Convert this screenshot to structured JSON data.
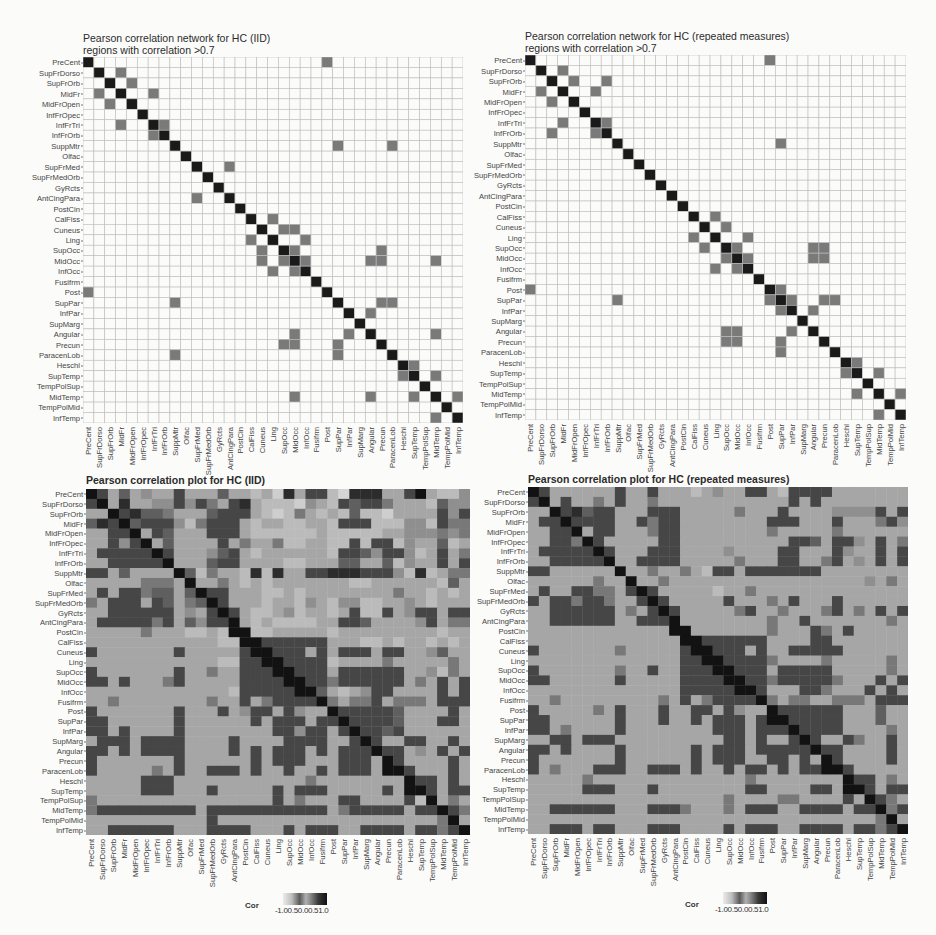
{
  "regions": [
    "PreCent",
    "SupFrDorso",
    "SupFrOrb",
    "MidFr",
    "MidFrOpen",
    "InfFrOpec",
    "InfFrTri",
    "InfFrOrb",
    "SuppMtr",
    "Olfac",
    "SupFrMed",
    "SupFrMedOrb",
    "GyRcts",
    "AntCingPara",
    "PostCin",
    "CalFiss",
    "Cuneus",
    "Ling",
    "SupOcc",
    "MidOcc",
    "InfOcc",
    "Fusifrm",
    "Post",
    "SupPar",
    "InfPar",
    "SupMarg",
    "Angular",
    "Precun",
    "ParacenLob",
    "Heschl",
    "SupTemp",
    "TempPolSup",
    "MidTemp",
    "TempPolMid",
    "InfTemp"
  ],
  "colors": {
    "diagonal": "#1a1a1a",
    "edge": "#7a7a7a",
    "empty": "#fbfbfa",
    "gridline": "#bdbdbd",
    "scale_low": "#e6e6e6",
    "scale_high": "#111111"
  },
  "panels": {
    "net_iid": {
      "title_line1": "Pearson correlation network for HC (IID)",
      "title_line2": "regions with correlation >0.7"
    },
    "net_rm": {
      "title_line1": "Pearson correlation network for HC (repeated measures)",
      "title_line2": "regions with correlation >0.7"
    },
    "cor_iid": {
      "title": "Pearson correlation plot for HC (IID)"
    },
    "cor_rm": {
      "title": "Pearson correlation plot for HC (repeated measures)"
    }
  },
  "legend": {
    "title": "Cor",
    "ticks": [
      "-1.0",
      "-0.5",
      "0.0",
      "0.5",
      "1.0"
    ],
    "tick_text": "-1.00.50.00.51.0"
  },
  "chart_data": [
    {
      "type": "heatmap",
      "title": "Pearson correlation network for HC (IID)",
      "subtitle": "regions with correlation >0.7",
      "threshold": 0.7,
      "xlabel": "",
      "ylabel": "",
      "edges": [
        [
          0,
          22
        ],
        [
          1,
          3
        ],
        [
          2,
          4
        ],
        [
          3,
          6
        ],
        [
          6,
          7
        ],
        [
          8,
          23
        ],
        [
          8,
          28
        ],
        [
          10,
          13
        ],
        [
          15,
          17
        ],
        [
          16,
          18
        ],
        [
          16,
          19
        ],
        [
          17,
          20
        ],
        [
          18,
          19
        ],
        [
          19,
          20
        ],
        [
          18,
          27
        ],
        [
          19,
          26
        ],
        [
          19,
          27
        ],
        [
          19,
          32
        ],
        [
          23,
          27
        ],
        [
          23,
          28
        ],
        [
          24,
          26
        ],
        [
          26,
          32
        ],
        [
          29,
          30
        ],
        [
          30,
          32
        ],
        [
          32,
          34
        ]
      ]
    },
    {
      "type": "heatmap",
      "title": "Pearson correlation network for HC (repeated measures)",
      "subtitle": "regions with correlation >0.7",
      "threshold": 0.7,
      "xlabel": "",
      "ylabel": "",
      "edges": [
        [
          0,
          22
        ],
        [
          1,
          3
        ],
        [
          2,
          4
        ],
        [
          2,
          7
        ],
        [
          3,
          6
        ],
        [
          6,
          7
        ],
        [
          8,
          23
        ],
        [
          15,
          17
        ],
        [
          16,
          18
        ],
        [
          17,
          20
        ],
        [
          18,
          19
        ],
        [
          18,
          27
        ],
        [
          19,
          20
        ],
        [
          19,
          26
        ],
        [
          22,
          23
        ],
        [
          23,
          24
        ],
        [
          23,
          27
        ],
        [
          23,
          28
        ],
        [
          24,
          26
        ],
        [
          26,
          18
        ],
        [
          27,
          19
        ],
        [
          28,
          23
        ],
        [
          29,
          30
        ],
        [
          30,
          32
        ],
        [
          32,
          34
        ]
      ]
    },
    {
      "type": "heatmap",
      "title": "Pearson correlation plot for HC (IID)",
      "legend_title": "Cor",
      "legend_ticks": [
        -1.0,
        -0.5,
        0.0,
        0.5,
        1.0
      ],
      "value_encoding": "digit d -> correlation = (d-2)/7 (approx, 0..9)",
      "rows": [
        "97363433733363323183772088833793224",
        "79383344747537832221432767753332644",
        "33978665333677732125323262213333747",
        "68796777425777323322332777222442755",
        "33779376333777322222232222233444545",
        "33747936333373533522332272772433623",
        "37777797333467323333332776477423735",
        "33777779333677333322333663362433737",
        "77363333962533282833778887774282355",
        "33333555393353232333333322333333263",
        "37377566369773332232333333335332323",
        "53777376356973332332432442233432333",
        "33777777343797322342332372273477377",
        "37777757364779323222233776333347355",
        "33333533322329322333332333333333233",
        "33333333333322977777773332232332323",
        "73333333733333797777373777377334633",
        "33333333333322779777772333353333353",
        "73333333733533777977773777777334253",
        "77373335733333777797775777777353737",
        "33333333333332777779763234773333737",
        "33533333333533735777795355735553777",
        "73333333733373477374339777776333373",
        "77333333733333373777377977776333773",
        "77373333733333333774773797767333333",
        "37773777733337333377773379733773373",
        "77373777733337373777373777977343737",
        "73333333733333373777333777397333373",
        "73333353733777373373373777397733373",
        "33333777333333333333533333333977373",
        "33333777333733333737773333373997377",
        "53333333333333333735333773333729353",
        "57777777773777777777773577777377975",
        "33333333333733333333333333333333593",
        "33777777333777733373777337777377579"
      ]
    },
    {
      "type": "heatmap",
      "title": "Pearson correlation plot for HC (repeated measures)",
      "legend_title": "Cor",
      "legend_ticks": [
        -1.0,
        -0.5,
        0.0,
        0.5,
        1.0
      ],
      "value_encoding": "digit d -> correlation = (d-2)/7 (approx, 0..9)",
      "rows": [
        "97333333733733323433773277773333333",
        "79373353733533333333333373733333333",
        "33978677333777333335333733334444737",
        "37797777337577333333337773337333574",
        "33779377333577333333335333335333333",
        "33775973333377333333333377637743735",
        "37777797333777333343333773337433737",
        "33777779337777333335333773357343737",
        "77333333933533532773777777733333333",
        "33333353393353333333333333333334353",
        "37337755379733333233533333333333333",
        "73775775337973333373335373337333333",
        "33777777353797333335733533357353737",
        "33777777337779333333335337333333353",
        "33333333333339333333335333753733333",
        "33333333333333977777773333773333333",
        "73333333533333797777373377777333333",
        "33333333333333779777775333353333353",
        "73333333533733777977773777773333353",
        "77333333733333777797775777775333737",
        "33333333333333777779773337753337373",
        "33533333333353735777795355335553777",
        "73333353733373377374339777777333633",
        "77333333733373373777379977777333633",
        "77353333733333333777377797777333353",
        "33773777333333333377373379733753373",
        "77373333733333373777377777977333373",
        "73333333733333373777337737397333373",
        "73533377733777373373773737797733333",
        "33333533333333333333533333333977353",
        "33333777333733333333773333773997377",
        "33333333333333333353333553333739753",
        "33777777333777533353777337777377957",
        "33333333333333333333333333333333593",
        "33777377333777333373777337777377579"
      ]
    }
  ]
}
